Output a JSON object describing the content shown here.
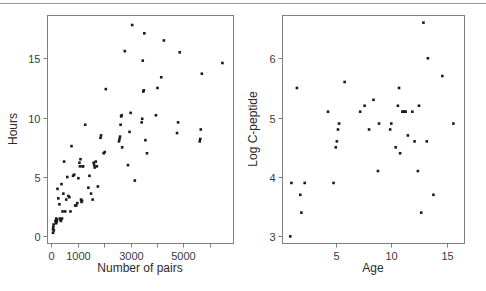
{
  "figure": {
    "background_color": "#ffffff",
    "frame_color": "#7f7f7f",
    "point_color": "#1a1a1a",
    "panel_count": 2
  },
  "chart_data": [
    {
      "type": "scatter",
      "panel": "left",
      "title": "",
      "xlabel": "Number of pairs",
      "ylabel": "Hours",
      "xlim": [
        -150,
        6900
      ],
      "ylim": [
        -0.6,
        18.6
      ],
      "xticks": [
        0,
        1000,
        2000,
        3000,
        4000,
        5000,
        6000
      ],
      "xtick_labels": [
        "0",
        "1000",
        "",
        "3000",
        "",
        "5000",
        ""
      ],
      "yticks": [
        0,
        5,
        10,
        15
      ],
      "ytick_labels": [
        "0",
        "5",
        "10",
        "15"
      ],
      "grid": false,
      "legend": false,
      "points": [
        [
          60,
          0.3
        ],
        [
          60,
          0.6
        ],
        [
          70,
          0.8
        ],
        [
          80,
          1.0
        ],
        [
          90,
          0.5
        ],
        [
          150,
          1.3
        ],
        [
          170,
          1.1
        ],
        [
          180,
          1.5
        ],
        [
          200,
          1.2
        ],
        [
          210,
          1.4
        ],
        [
          230,
          4.0
        ],
        [
          260,
          3.2
        ],
        [
          300,
          2.7
        ],
        [
          320,
          1.5
        ],
        [
          340,
          1.4
        ],
        [
          360,
          1.3
        ],
        [
          380,
          4.4
        ],
        [
          400,
          1.5
        ],
        [
          420,
          2.1
        ],
        [
          450,
          3.6
        ],
        [
          480,
          6.3
        ],
        [
          520,
          2.1
        ],
        [
          560,
          3.1
        ],
        [
          600,
          5.0
        ],
        [
          640,
          3.4
        ],
        [
          680,
          3.3
        ],
        [
          720,
          2.1
        ],
        [
          760,
          7.6
        ],
        [
          820,
          5.1
        ],
        [
          860,
          5.2
        ],
        [
          900,
          2.6
        ],
        [
          940,
          2.6
        ],
        [
          980,
          2.8
        ],
        [
          1020,
          4.9
        ],
        [
          1060,
          6.2
        ],
        [
          1080,
          5.9
        ],
        [
          1100,
          6.5
        ],
        [
          1120,
          3.1
        ],
        [
          1140,
          2.9
        ],
        [
          1160,
          3.0
        ],
        [
          1180,
          5.9
        ],
        [
          1200,
          5.9
        ],
        [
          1280,
          9.4
        ],
        [
          1400,
          4.1
        ],
        [
          1440,
          5.1
        ],
        [
          1500,
          3.6
        ],
        [
          1560,
          3.1
        ],
        [
          1600,
          6.2
        ],
        [
          1620,
          6.0
        ],
        [
          1640,
          5.8
        ],
        [
          1680,
          6.3
        ],
        [
          1720,
          5.9
        ],
        [
          1760,
          4.2
        ],
        [
          1860,
          8.3
        ],
        [
          1880,
          8.5
        ],
        [
          1980,
          7.0
        ],
        [
          2020,
          7.1
        ],
        [
          2060,
          12.4
        ],
        [
          2560,
          8.0
        ],
        [
          2580,
          8.2
        ],
        [
          2600,
          8.4
        ],
        [
          2620,
          9.4
        ],
        [
          2640,
          10.1
        ],
        [
          2660,
          10.2
        ],
        [
          2680,
          7.5
        ],
        [
          2780,
          15.6
        ],
        [
          2900,
          6.0
        ],
        [
          2960,
          8.8
        ],
        [
          3000,
          10.4
        ],
        [
          3060,
          17.8
        ],
        [
          3160,
          4.7
        ],
        [
          3420,
          9.6
        ],
        [
          3440,
          9.9
        ],
        [
          3460,
          14.8
        ],
        [
          3480,
          12.2
        ],
        [
          3500,
          12.3
        ],
        [
          3520,
          17.1
        ],
        [
          3560,
          8.1
        ],
        [
          3620,
          7.0
        ],
        [
          3960,
          10.2
        ],
        [
          4020,
          12.5
        ],
        [
          4160,
          13.4
        ],
        [
          4260,
          16.5
        ],
        [
          4760,
          8.7
        ],
        [
          4800,
          9.6
        ],
        [
          4860,
          15.5
        ],
        [
          5620,
          8.0
        ],
        [
          5640,
          8.2
        ],
        [
          5660,
          9.0
        ],
        [
          5700,
          13.7
        ],
        [
          6480,
          14.6
        ]
      ]
    },
    {
      "type": "scatter",
      "panel": "right",
      "title": "",
      "xlabel": "Age",
      "ylabel": "Log C-peptide",
      "xlim": [
        0.2,
        16.6
      ],
      "ylim": [
        2.88,
        6.72
      ],
      "xticks": [
        5,
        10,
        15
      ],
      "xtick_labels": [
        "5",
        "10",
        "15"
      ],
      "yticks": [
        3,
        4,
        5,
        6
      ],
      "ytick_labels": [
        "3",
        "4",
        "5",
        "6"
      ],
      "grid": false,
      "legend": false,
      "points": [
        [
          0.9,
          3.0
        ],
        [
          1.0,
          3.9
        ],
        [
          1.5,
          5.5
        ],
        [
          1.8,
          3.7
        ],
        [
          1.9,
          3.4
        ],
        [
          2.2,
          3.9
        ],
        [
          4.3,
          5.1
        ],
        [
          4.8,
          3.9
        ],
        [
          5.0,
          4.5
        ],
        [
          5.1,
          4.6
        ],
        [
          5.2,
          4.8
        ],
        [
          5.3,
          4.9
        ],
        [
          5.8,
          5.6
        ],
        [
          7.2,
          5.1
        ],
        [
          7.6,
          5.2
        ],
        [
          8.0,
          4.8
        ],
        [
          8.4,
          5.3
        ],
        [
          8.8,
          4.1
        ],
        [
          8.9,
          4.9
        ],
        [
          9.9,
          4.8
        ],
        [
          10.0,
          4.9
        ],
        [
          10.4,
          4.5
        ],
        [
          10.6,
          5.2
        ],
        [
          10.7,
          5.5
        ],
        [
          10.8,
          4.4
        ],
        [
          11.0,
          5.1
        ],
        [
          11.1,
          5.1
        ],
        [
          11.2,
          5.1
        ],
        [
          11.3,
          5.1
        ],
        [
          11.5,
          4.7
        ],
        [
          11.9,
          5.1
        ],
        [
          12.1,
          4.6
        ],
        [
          12.4,
          4.1
        ],
        [
          12.5,
          5.2
        ],
        [
          12.7,
          3.4
        ],
        [
          12.9,
          6.6
        ],
        [
          13.2,
          4.6
        ],
        [
          13.3,
          6.0
        ],
        [
          13.8,
          3.7
        ],
        [
          14.6,
          5.7
        ],
        [
          15.6,
          4.9
        ]
      ]
    }
  ]
}
